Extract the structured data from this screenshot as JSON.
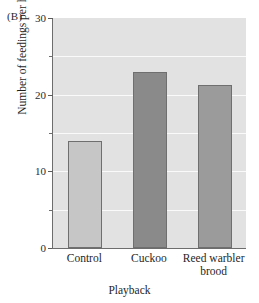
{
  "panel": {
    "label": "(B)"
  },
  "chart_data": {
    "type": "bar",
    "title": "",
    "xlabel": "Playback",
    "ylabel": "Number of feedings per hour",
    "categories": [
      "Control",
      "Cuckoo",
      "Reed warbler\nbrood"
    ],
    "values": [
      14.0,
      23.0,
      21.3
    ],
    "series": [
      {
        "name": "Number of feedings per hour",
        "values": [
          14.0,
          23.0,
          21.3
        ]
      }
    ],
    "bar_colors": [
      "#c6c6c6",
      "#8a8a8a",
      "#9b9b9b"
    ],
    "ylim": [
      0,
      30
    ],
    "yticks": [
      0,
      10,
      20,
      30
    ],
    "ytick_labels": [
      "0",
      "10",
      "20",
      "30"
    ],
    "yticks_minor": [
      5,
      15,
      25
    ],
    "grid": true,
    "gridline_color": "#fafafa",
    "plot_background": "#e2e2e2",
    "legend": "none"
  }
}
